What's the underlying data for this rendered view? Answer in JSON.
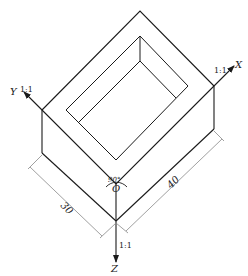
{
  "diagram": {
    "type": "oblique-axonometric-box",
    "axes": {
      "x": {
        "label": "X",
        "scale": "1:1"
      },
      "y": {
        "label": "Y",
        "scale": "1:1"
      },
      "z": {
        "label": "Z",
        "scale": "1:1"
      }
    },
    "origin_label": "O",
    "angle_label": "90°",
    "dimensions": {
      "left": "30",
      "right": "40"
    },
    "colors": {
      "line": "#1a1a1a",
      "dimension": "#888888"
    }
  }
}
